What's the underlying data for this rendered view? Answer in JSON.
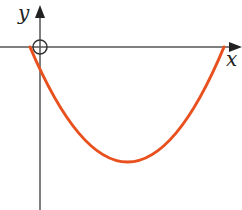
{
  "diagram": {
    "type": "function-graph",
    "axes": {
      "x_label": "x",
      "y_label": "y",
      "origin_marker": "circle"
    },
    "curve": {
      "shape": "parabola",
      "color": "#e8501e",
      "opens": "up"
    },
    "colors": {
      "axis": "#555555",
      "curve": "#e8501e"
    }
  }
}
